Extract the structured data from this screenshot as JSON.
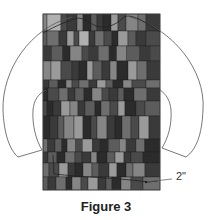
{
  "figure": {
    "caption": "Figure 3",
    "dimension_label": "2\"",
    "panel": {
      "x": 43,
      "y": 14,
      "width": 117,
      "height": 176
    },
    "colors": {
      "background": "#ffffff",
      "outline": "#555555",
      "panel_border": "#444444",
      "shades": [
        "#2b2b2b",
        "#3a3a3a",
        "#4a4a4a",
        "#5c5c5c",
        "#6e6e6e",
        "#858585",
        "#9a9a9a",
        "#b0b0b0"
      ]
    },
    "rows": [
      {
        "y": 14,
        "h": 17,
        "cells": [
          [
            4,
            5
          ],
          [
            14,
            7
          ],
          [
            6,
            2
          ],
          [
            10,
            1
          ],
          [
            6,
            5
          ],
          [
            8,
            0
          ],
          [
            6,
            3
          ],
          [
            6,
            1
          ],
          [
            8,
            0
          ],
          [
            7,
            6
          ],
          [
            8,
            2
          ],
          [
            12,
            5
          ],
          [
            8,
            4
          ],
          [
            14,
            1
          ]
        ]
      },
      {
        "y": 31,
        "h": 15,
        "cells": [
          [
            4,
            3
          ],
          [
            12,
            4
          ],
          [
            8,
            1
          ],
          [
            7,
            6
          ],
          [
            5,
            2
          ],
          [
            10,
            7
          ],
          [
            6,
            1
          ],
          [
            9,
            4
          ],
          [
            8,
            2
          ],
          [
            6,
            0
          ],
          [
            10,
            6
          ],
          [
            8,
            3
          ],
          [
            10,
            1
          ],
          [
            14,
            2
          ]
        ]
      },
      {
        "y": 46,
        "h": 15,
        "cells": [
          [
            8,
            1
          ],
          [
            10,
            3
          ],
          [
            7,
            0
          ],
          [
            11,
            5
          ],
          [
            6,
            2
          ],
          [
            9,
            1
          ],
          [
            10,
            4
          ],
          [
            7,
            0
          ],
          [
            9,
            5
          ],
          [
            12,
            3
          ],
          [
            10,
            1
          ],
          [
            9,
            2
          ]
        ]
      },
      {
        "y": 61,
        "h": 19,
        "cells": [
          [
            8,
            5
          ],
          [
            10,
            6
          ],
          [
            11,
            2
          ],
          [
            7,
            1
          ],
          [
            8,
            0
          ],
          [
            6,
            6
          ],
          [
            9,
            3
          ],
          [
            8,
            1
          ],
          [
            7,
            5
          ],
          [
            11,
            0
          ],
          [
            9,
            6
          ],
          [
            10,
            4
          ],
          [
            13,
            1
          ]
        ]
      },
      {
        "y": 80,
        "h": 8,
        "cells": [
          [
            6,
            1
          ],
          [
            9,
            3
          ],
          [
            8,
            0
          ],
          [
            6,
            5
          ],
          [
            7,
            2
          ],
          [
            10,
            4
          ],
          [
            8,
            1
          ],
          [
            9,
            6
          ],
          [
            7,
            3
          ],
          [
            10,
            0
          ],
          [
            9,
            5
          ],
          [
            14,
            2
          ],
          [
            14,
            4
          ]
        ]
      },
      {
        "y": 88,
        "h": 13,
        "cells": [
          [
            5,
            0
          ],
          [
            11,
            2
          ],
          [
            9,
            4
          ],
          [
            7,
            1
          ],
          [
            9,
            3
          ],
          [
            8,
            0
          ],
          [
            10,
            5
          ],
          [
            7,
            2
          ],
          [
            9,
            1
          ],
          [
            6,
            3
          ],
          [
            10,
            0
          ],
          [
            13,
            4
          ],
          [
            13,
            1
          ]
        ]
      },
      {
        "y": 101,
        "h": 15,
        "cells": [
          [
            4,
            2
          ],
          [
            6,
            0
          ],
          [
            8,
            1
          ],
          [
            9,
            6
          ],
          [
            8,
            5
          ],
          [
            7,
            1
          ],
          [
            10,
            3
          ],
          [
            6,
            0
          ],
          [
            9,
            4
          ],
          [
            8,
            2
          ],
          [
            7,
            6
          ],
          [
            11,
            0
          ],
          [
            9,
            2
          ],
          [
            15,
            3
          ]
        ]
      },
      {
        "y": 116,
        "h": 23,
        "cells": [
          [
            7,
            0
          ],
          [
            8,
            1
          ],
          [
            6,
            3
          ],
          [
            10,
            5
          ],
          [
            9,
            6
          ],
          [
            8,
            0
          ],
          [
            6,
            2
          ],
          [
            10,
            5
          ],
          [
            8,
            1
          ],
          [
            7,
            0
          ],
          [
            9,
            4
          ],
          [
            8,
            2
          ],
          [
            10,
            6
          ],
          [
            11,
            1
          ]
        ]
      },
      {
        "y": 139,
        "h": 13,
        "cells": [
          [
            4,
            4
          ],
          [
            7,
            1
          ],
          [
            6,
            3
          ],
          [
            5,
            0
          ],
          [
            8,
            5
          ],
          [
            6,
            2
          ],
          [
            9,
            6
          ],
          [
            7,
            1
          ],
          [
            8,
            0
          ],
          [
            10,
            3
          ],
          [
            6,
            5
          ],
          [
            9,
            1
          ],
          [
            8,
            4
          ],
          [
            14,
            0
          ]
        ]
      },
      {
        "y": 152,
        "h": 11,
        "cells": [
          [
            5,
            1
          ],
          [
            9,
            3
          ],
          [
            8,
            0
          ],
          [
            10,
            4
          ],
          [
            7,
            2
          ],
          [
            9,
            1
          ],
          [
            6,
            5
          ],
          [
            10,
            0
          ],
          [
            8,
            3
          ],
          [
            9,
            6
          ],
          [
            7,
            1
          ],
          [
            12,
            2
          ],
          [
            17,
            0
          ]
        ]
      },
      {
        "y": 163,
        "h": 14,
        "cells": [
          [
            6,
            4
          ],
          [
            10,
            2
          ],
          [
            9,
            6
          ],
          [
            7,
            1
          ],
          [
            8,
            0
          ],
          [
            9,
            5
          ],
          [
            7,
            3
          ],
          [
            10,
            1
          ],
          [
            8,
            6
          ],
          [
            9,
            0
          ],
          [
            7,
            4
          ],
          [
            12,
            5
          ],
          [
            15,
            1
          ]
        ]
      },
      {
        "y": 177,
        "h": 13,
        "cells": [
          [
            5,
            3
          ],
          [
            8,
            1
          ],
          [
            10,
            4
          ],
          [
            6,
            0
          ],
          [
            9,
            5
          ],
          [
            7,
            2
          ],
          [
            10,
            6
          ],
          [
            8,
            1
          ],
          [
            6,
            3
          ],
          [
            9,
            0
          ],
          [
            10,
            5
          ],
          [
            12,
            2
          ],
          [
            17,
            4
          ]
        ]
      }
    ]
  }
}
